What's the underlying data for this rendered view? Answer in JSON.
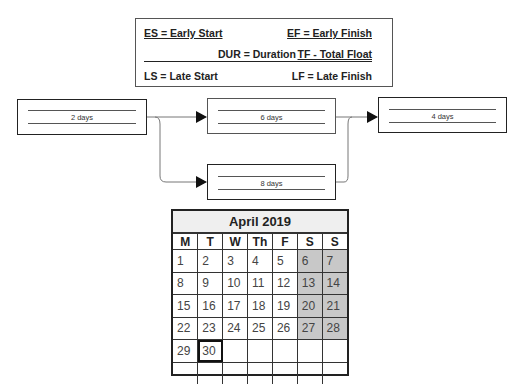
{
  "legend": {
    "es": "ES = Early Start",
    "ef": "EF = Early Finish",
    "dur": "DUR = Duration",
    "tf": "TF - Total Float",
    "ls": "LS = Late Start",
    "lf": "LF = Late Finish"
  },
  "nodes": [
    {
      "id": "task-a",
      "duration": "2 days"
    },
    {
      "id": "task-b",
      "duration": "6 days"
    },
    {
      "id": "task-c",
      "duration": "8 days"
    },
    {
      "id": "task-d",
      "duration": "4 days"
    }
  ],
  "calendar": {
    "title": "April 2019",
    "weekdays": [
      "M",
      "T",
      "W",
      "Th",
      "F",
      "S",
      "S"
    ],
    "weeks": [
      [
        "1",
        "2",
        "3",
        "4",
        "5",
        "6",
        "7"
      ],
      [
        "8",
        "9",
        "10",
        "11",
        "12",
        "13",
        "14"
      ],
      [
        "15",
        "16",
        "17",
        "18",
        "19",
        "20",
        "21"
      ],
      [
        "22",
        "23",
        "24",
        "25",
        "26",
        "27",
        "28"
      ],
      [
        "29",
        "30",
        "",
        "",
        "",
        "",
        ""
      ],
      [
        "",
        "",
        "",
        "",
        "",
        "",
        ""
      ]
    ],
    "selected_day": "30",
    "weekend_color": "#c8c8c8"
  }
}
